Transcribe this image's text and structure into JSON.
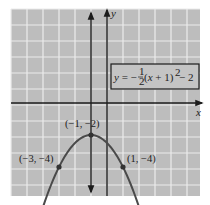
{
  "chart_data": {
    "type": "line",
    "title": "",
    "xlabel": "x",
    "ylabel": "y",
    "xlim": [
      -6,
      5.75
    ],
    "ylim": [
      -5.8,
      5.9
    ],
    "grid": true,
    "equation_label": {
      "prefix": "y = −",
      "frac_num": "1",
      "frac_den": "2",
      "body": "(x + 1)",
      "exp": "2",
      "suffix": " − 2"
    },
    "series": [
      {
        "name": "y = -1/2(x+1)^2 - 2",
        "function": "-0.5*(x+1)^2 - 2",
        "x_range": [
          -4.75,
          2.75
        ],
        "arrows": "both_ends"
      }
    ],
    "axis_of_symmetry": {
      "x": -1,
      "arrows": "both_ends"
    },
    "points": [
      {
        "x": -1,
        "y": -2,
        "label": "(−1, −2)"
      },
      {
        "x": -3,
        "y": -4,
        "label": "(−3, −4)"
      },
      {
        "x": 1,
        "y": -4,
        "label": "(1, −4)"
      }
    ]
  },
  "colors": {
    "grid_background": "#bdbdbd",
    "grid_lines": "#ececec",
    "curve": "#4a4a4a",
    "axes": "#1c1c1c"
  }
}
